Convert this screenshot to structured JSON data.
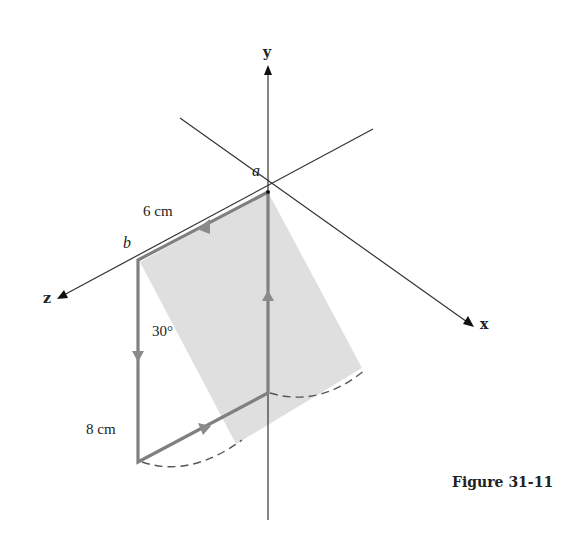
{
  "figure": {
    "caption": "Figure 31-11"
  },
  "axes": {
    "x_label": "x",
    "y_label": "y",
    "z_label": "z"
  },
  "points": {
    "a": "a",
    "b": "b"
  },
  "dimensions": {
    "top_side": "6 cm",
    "left_side": "8 cm",
    "angle": "30°"
  },
  "colors": {
    "loop": "#7a7a7a",
    "shade": "#d9d9d9",
    "axis": "#333333"
  }
}
